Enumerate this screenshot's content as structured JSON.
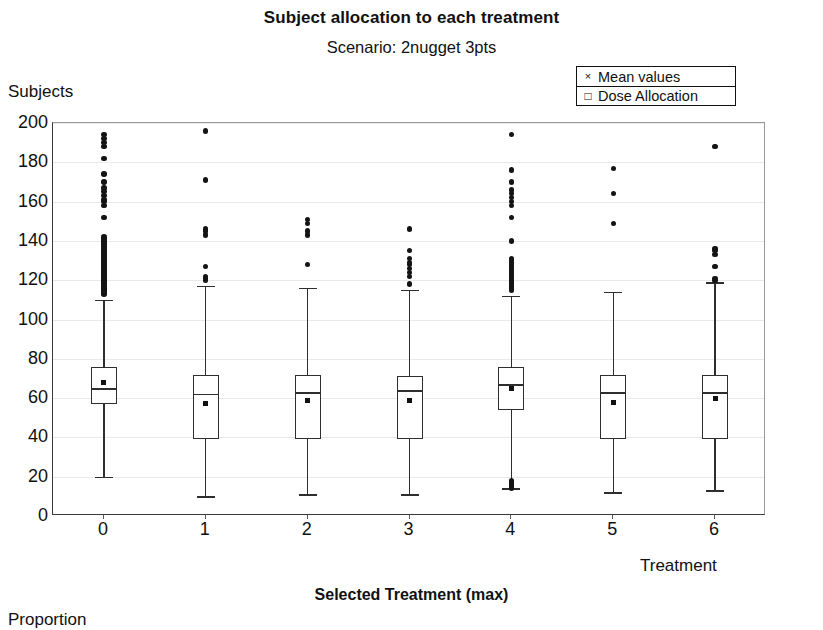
{
  "chart": {
    "title": "Subject allocation to each treatment",
    "subtitle": "Scenario: 2nugget 3pts",
    "y_axis_title": "Subjects",
    "x_axis_title": "Treatment"
  },
  "legend": {
    "position": "top-right",
    "items": [
      {
        "marker": "x-marker-icon",
        "glyph": "×",
        "label": "Mean values"
      },
      {
        "marker": "square-marker-icon",
        "glyph": "□",
        "label": "Dose Allocation"
      }
    ]
  },
  "lower_panel": {
    "title": "Selected Treatment (max)",
    "y_axis_title": "Proportion"
  },
  "chart_data": {
    "type": "box",
    "title": "Subject allocation to each treatment",
    "subtitle": "Scenario: 2nugget 3pts",
    "xlabel": "Treatment",
    "ylabel": "Subjects",
    "xlim": [
      -0.5,
      6.5
    ],
    "ylim": [
      0,
      200
    ],
    "ytick_labels": [
      "0",
      "20",
      "40",
      "60",
      "80",
      "100",
      "120",
      "140",
      "160",
      "180",
      "200"
    ],
    "yticks": [
      0,
      20,
      40,
      60,
      80,
      100,
      120,
      140,
      160,
      180,
      200
    ],
    "xtick_labels": [
      "0",
      "1",
      "2",
      "3",
      "4",
      "5",
      "6"
    ],
    "xticks": [
      0,
      1,
      2,
      3,
      4,
      5,
      6
    ],
    "grid": true,
    "legend": [
      "Mean values",
      "Dose Allocation"
    ],
    "categories": [
      "0",
      "1",
      "2",
      "3",
      "4",
      "5",
      "6"
    ],
    "boxes": [
      {
        "category": "0",
        "whisker_low": 20,
        "q1": 57,
        "median": 65,
        "q3": 76,
        "whisker_high": 110,
        "mean": 68,
        "outliers": [
          113,
          114,
          115,
          116,
          116,
          117,
          118,
          118,
          119,
          120,
          120,
          121,
          122,
          122,
          123,
          124,
          125,
          126,
          127,
          128,
          129,
          130,
          131,
          132,
          133,
          134,
          135,
          136,
          137,
          138,
          139,
          140,
          141,
          142,
          152,
          158,
          160,
          161,
          163,
          165,
          167,
          170,
          174,
          182,
          188,
          190,
          192,
          194
        ]
      },
      {
        "category": "1",
        "whisker_low": 10,
        "q1": 39,
        "median": 62,
        "q3": 72,
        "whisker_high": 117,
        "mean": 57,
        "outliers": [
          120,
          121,
          122,
          127,
          143,
          145,
          146,
          171,
          196
        ]
      },
      {
        "category": "2",
        "whisker_low": 11,
        "q1": 39,
        "median": 63,
        "q3": 72,
        "whisker_high": 116,
        "mean": 59,
        "outliers": [
          128,
          143,
          145,
          149,
          151
        ]
      },
      {
        "category": "3",
        "whisker_low": 11,
        "q1": 39,
        "median": 64,
        "q3": 71,
        "whisker_high": 115,
        "mean": 59,
        "outliers": [
          118,
          122,
          124,
          126,
          128,
          129,
          131,
          135,
          146
        ]
      },
      {
        "category": "4",
        "whisker_low": 14,
        "q1": 54,
        "median": 67,
        "q3": 76,
        "whisker_high": 112,
        "mean": 65,
        "outliers": [
          14,
          15,
          15,
          16,
          16,
          17,
          17,
          18,
          115,
          116,
          117,
          118,
          119,
          120,
          121,
          122,
          123,
          124,
          125,
          126,
          127,
          128,
          129,
          130,
          131,
          140,
          152,
          158,
          160,
          162,
          164,
          166,
          170,
          176,
          194
        ]
      },
      {
        "category": "5",
        "whisker_low": 12,
        "q1": 39,
        "median": 63,
        "q3": 72,
        "whisker_high": 114,
        "mean": 58,
        "outliers": [
          149,
          164,
          177
        ]
      },
      {
        "category": "6",
        "whisker_low": 13,
        "q1": 39,
        "median": 63,
        "q3": 72,
        "whisker_high": 119,
        "mean": 60,
        "outliers": [
          120,
          121,
          127,
          133,
          135,
          136,
          188
        ]
      }
    ]
  }
}
